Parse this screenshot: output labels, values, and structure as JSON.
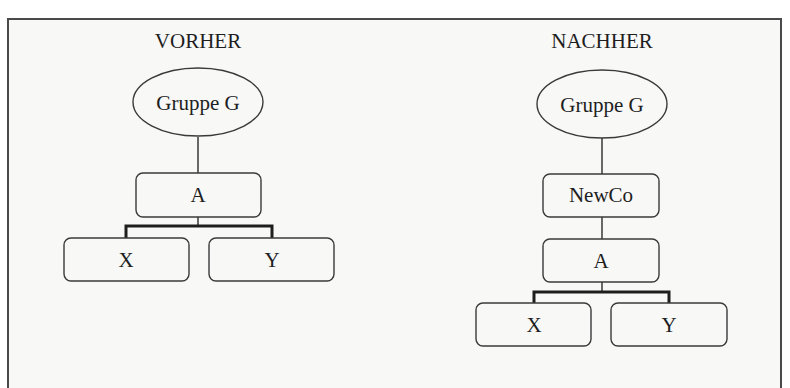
{
  "diagram": {
    "colors": {
      "frame": "#4a4a4a",
      "background": "#f8f8f7",
      "stroke": "#3a3a3a",
      "text": "#1e1e1e"
    },
    "before": {
      "title": "VORHER",
      "root": {
        "label": "Gruppe G",
        "shape": "ellipse"
      },
      "nodes": [
        {
          "label": "A",
          "shape": "rounded-rect",
          "parent": "Gruppe G"
        },
        {
          "label": "X",
          "shape": "rounded-rect",
          "parent": "A"
        },
        {
          "label": "Y",
          "shape": "rounded-rect",
          "parent": "A"
        }
      ]
    },
    "after": {
      "title": "NACHHER",
      "root": {
        "label": "Gruppe G",
        "shape": "ellipse"
      },
      "nodes": [
        {
          "label": "NewCo",
          "shape": "rounded-rect",
          "parent": "Gruppe G"
        },
        {
          "label": "A",
          "shape": "rounded-rect",
          "parent": "NewCo"
        },
        {
          "label": "X",
          "shape": "rounded-rect",
          "parent": "A"
        },
        {
          "label": "Y",
          "shape": "rounded-rect",
          "parent": "A"
        }
      ]
    }
  }
}
